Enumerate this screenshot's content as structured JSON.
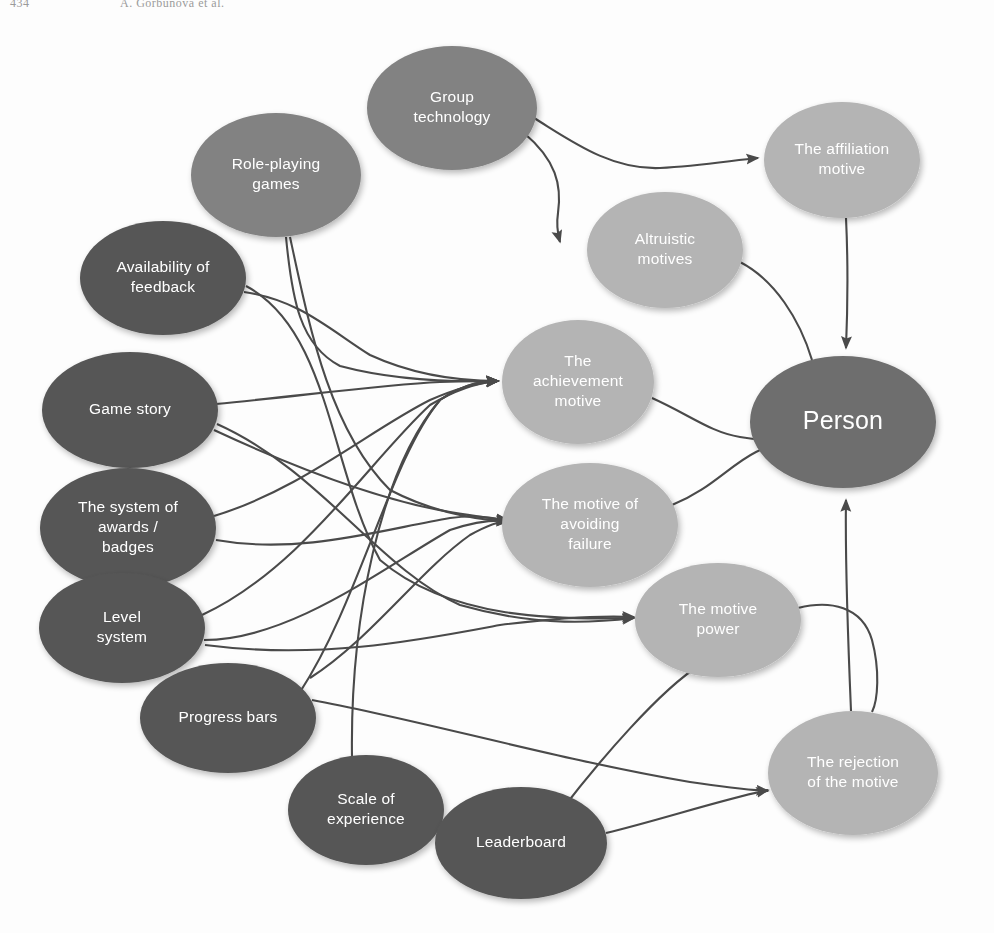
{
  "header": {
    "folio": "434",
    "running_head": "A. Gorbunova et al."
  },
  "diagram": {
    "colors": {
      "node_dark": "#565656",
      "node_medium": "#828282",
      "node_light": "#b4b4b4",
      "node_person": "#6e6e6e",
      "edge": "#4a4a4a",
      "label_text": "#ffffff",
      "background": "#fdfdfd"
    },
    "nodes": [
      {
        "id": "group_technology",
        "label": "Group technology",
        "lines": [
          "Group",
          "technology"
        ],
        "cx": 452,
        "cy": 108,
        "rx": 85,
        "ry": 62,
        "tone": "medium"
      },
      {
        "id": "role_playing_games",
        "label": "Role-playing games",
        "lines": [
          "Role-playing",
          "games"
        ],
        "cx": 276,
        "cy": 175,
        "rx": 85,
        "ry": 62,
        "tone": "medium"
      },
      {
        "id": "affiliation_motive",
        "label": "The affiliation motive",
        "lines": [
          "The affiliation",
          "motive"
        ],
        "cx": 842,
        "cy": 160,
        "rx": 78,
        "ry": 58,
        "tone": "light"
      },
      {
        "id": "altruistic_motives",
        "label": "Altruistic motives",
        "lines": [
          "Altruistic",
          "motives"
        ],
        "cx": 665,
        "cy": 250,
        "rx": 78,
        "ry": 58,
        "tone": "light"
      },
      {
        "id": "availability_feedback",
        "label": "Availability of feedback",
        "lines": [
          "Availability of",
          "feedback"
        ],
        "cx": 163,
        "cy": 278,
        "rx": 83,
        "ry": 57,
        "tone": "dark"
      },
      {
        "id": "game_story",
        "label": "Game story",
        "lines": [
          "Game story"
        ],
        "cx": 130,
        "cy": 410,
        "rx": 88,
        "ry": 58,
        "tone": "dark"
      },
      {
        "id": "achievement_motive",
        "label": "The achievement motive",
        "lines": [
          "The",
          "achievement",
          "motive"
        ],
        "cx": 578,
        "cy": 382,
        "rx": 76,
        "ry": 62,
        "tone": "light"
      },
      {
        "id": "person",
        "label": "Person",
        "lines": [
          "Person"
        ],
        "cx": 843,
        "cy": 422,
        "rx": 93,
        "ry": 66,
        "tone": "person"
      },
      {
        "id": "awards_badges",
        "label": "The system of awards / badges",
        "lines": [
          "The system of",
          "awards /",
          "badges"
        ],
        "cx": 128,
        "cy": 528,
        "rx": 88,
        "ry": 60,
        "tone": "dark"
      },
      {
        "id": "avoiding_failure",
        "label": "The motive of avoiding failure",
        "lines": [
          "The motive of",
          "avoiding",
          "failure"
        ],
        "cx": 590,
        "cy": 525,
        "rx": 88,
        "ry": 62,
        "tone": "light"
      },
      {
        "id": "level_system",
        "label": "Level system",
        "lines": [
          "Level",
          "system"
        ],
        "cx": 122,
        "cy": 628,
        "rx": 83,
        "ry": 55,
        "tone": "dark"
      },
      {
        "id": "motive_power",
        "label": "The motive power",
        "lines": [
          "The motive",
          "power"
        ],
        "cx": 718,
        "cy": 620,
        "rx": 83,
        "ry": 57,
        "tone": "light"
      },
      {
        "id": "progress_bars",
        "label": "Progress bars",
        "lines": [
          "Progress bars"
        ],
        "cx": 228,
        "cy": 718,
        "rx": 88,
        "ry": 55,
        "tone": "dark"
      },
      {
        "id": "rejection_motive",
        "label": "The rejection of the motive",
        "lines": [
          "The rejection",
          "of the motive"
        ],
        "cx": 853,
        "cy": 773,
        "rx": 85,
        "ry": 62,
        "tone": "light"
      },
      {
        "id": "scale_experience",
        "label": "Scale of experience",
        "lines": [
          "Scale of",
          "experience"
        ],
        "cx": 366,
        "cy": 810,
        "rx": 78,
        "ry": 55,
        "tone": "dark"
      },
      {
        "id": "leaderboard",
        "label": "Leaderboard",
        "lines": [
          "Leaderboard"
        ],
        "cx": 521,
        "cy": 843,
        "rx": 86,
        "ry": 56,
        "tone": "dark"
      }
    ],
    "edges": [
      {
        "from": "group_technology",
        "to": "affiliation_motive",
        "path": "M 534 118 C 570 140 610 170 660 168 C 700 166 735 160 758 158",
        "arrow": true
      },
      {
        "from": "group_technology",
        "to": "altruistic_motives",
        "path": "M 524 133 C 556 160 562 185 558 213 C 556 226 558 235 560 242",
        "arrow": true
      },
      {
        "from": "altruistic_motives",
        "to": "person",
        "path": "M 740 262 C 775 280 800 320 812 360 C 818 378 818 386 816 396",
        "arrow": true
      },
      {
        "from": "affiliation_motive",
        "to": "person",
        "path": "M 846 218 C 848 260 848 300 846 348",
        "arrow": true
      },
      {
        "from": "role_playing_games",
        "to": "achievement_motive",
        "path": "M 286 237 C 292 300 300 345 340 366 C 400 382 460 382 498 381",
        "arrow": true
      },
      {
        "from": "availability_feedback",
        "to": "achievement_motive",
        "path": "M 244 292 C 300 300 330 330 370 355 C 420 378 470 381 498 381",
        "arrow": true
      },
      {
        "from": "game_story",
        "to": "achievement_motive",
        "path": "M 216 404 C 300 396 380 385 440 382 C 468 381 486 381 498 381",
        "arrow": true
      },
      {
        "from": "awards_badges",
        "to": "achievement_motive",
        "path": "M 214 516 C 300 490 370 430 430 400 C 462 386 486 382 498 381",
        "arrow": true
      },
      {
        "from": "level_system",
        "to": "achievement_motive",
        "path": "M 202 615 C 300 570 370 460 430 405 C 462 386 486 382 498 381",
        "arrow": true
      },
      {
        "from": "progress_bars",
        "to": "achievement_motive",
        "path": "M 300 692 C 360 600 390 460 440 400 C 466 382 486 381 498 381",
        "arrow": true
      },
      {
        "from": "scale_experience",
        "to": "achievement_motive",
        "path": "M 352 757 C 350 620 380 470 440 400 C 466 382 486 381 498 381",
        "arrow": true
      },
      {
        "from": "game_story",
        "to": "avoiding_failure",
        "path": "M 214 430 C 300 470 380 500 450 512 C 480 517 496 519 508 520",
        "arrow": true
      },
      {
        "from": "awards_badges",
        "to": "avoiding_failure",
        "path": "M 216 540 C 300 555 380 530 450 518 C 480 514 496 519 508 521",
        "arrow": true
      },
      {
        "from": "level_system",
        "to": "avoiding_failure",
        "path": "M 204 640 C 290 640 380 570 450 530 C 480 520 496 520 508 521",
        "arrow": true
      },
      {
        "from": "progress_bars",
        "to": "avoiding_failure",
        "path": "M 310 678 C 370 640 420 570 470 535 C 490 524 500 521 508 521",
        "arrow": true
      },
      {
        "from": "role_playing_games",
        "to": "avoiding_failure",
        "path": "M 290 237 C 310 330 330 430 390 490 C 440 516 490 521 508 521",
        "arrow": true
      },
      {
        "from": "availability_feedback",
        "to": "motive_power",
        "path": "M 246 286 C 330 330 330 470 380 560 C 450 620 560 620 634 618",
        "arrow": true
      },
      {
        "from": "game_story",
        "to": "motive_power",
        "path": "M 217 424 C 320 470 380 570 460 605 C 540 628 600 622 634 618",
        "arrow": true
      },
      {
        "from": "level_system",
        "to": "motive_power",
        "path": "M 205 645 C 320 660 420 640 500 625 C 570 616 610 616 634 617",
        "arrow": true
      },
      {
        "from": "leaderboard",
        "to": "motive_power",
        "path": "M 560 812 C 600 760 660 690 700 665 C 708 658 710 655 712 650",
        "arrow": true
      },
      {
        "from": "achievement_motive",
        "to": "person",
        "path": "M 652 398 C 690 415 710 432 740 437 C 756 440 764 440 772 440",
        "arrow": true
      },
      {
        "from": "avoiding_failure",
        "to": "person",
        "path": "M 672 505 C 710 490 730 465 756 452 C 766 447 772 444 776 443",
        "arrow": true
      },
      {
        "from": "motive_power",
        "to": "rejection_motive",
        "path": "M 798 608 C 830 600 862 606 872 640 C 880 670 878 700 872 712",
        "arrow": false
      },
      {
        "from": "rejection_motive",
        "to": "person",
        "path": "M 851 711 C 848 640 845 560 846 500",
        "arrow": true
      },
      {
        "from": "leaderboard",
        "to": "rejection_motive",
        "path": "M 606 833 C 660 820 720 800 768 790",
        "arrow": true
      },
      {
        "from": "progress_bars",
        "to": "rejection_motive",
        "path": "M 312 700 C 420 720 560 760 690 782 C 730 788 752 790 768 791",
        "arrow": true
      }
    ]
  }
}
